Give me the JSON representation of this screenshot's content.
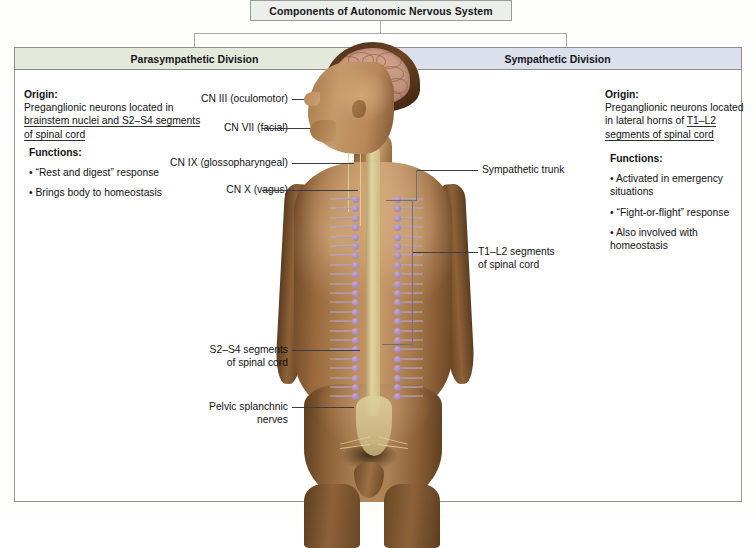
{
  "title": {
    "text": "Components of Autonomic Nervous System"
  },
  "divisions": {
    "left": {
      "header": "Parasympathetic Division",
      "origin_label": "Origin:",
      "origin_text": "Preganglionic neurons located in brainstem nuclei and S2–S4 segments of spinal cord",
      "functions_label": "Functions:",
      "functions": [
        "• “Rest and digest” response",
        "• Brings body to homeostasis"
      ],
      "header_color": "#e3eadb"
    },
    "right": {
      "header": "Sympathetic Division",
      "origin_label": "Origin:",
      "origin_text": "Preganglionic neurons located in lateral horns of T1–L2 segments of spinal cord",
      "functions_label": "Functions:",
      "functions": [
        "• Activated in emergency situations",
        "• “Fight-or-flight” response",
        "• Also involved with homeostasis"
      ],
      "header_color": "#dcdfec"
    }
  },
  "callouts": {
    "left": [
      {
        "text": "CN III (oculomotor)"
      },
      {
        "text": "CN VII (facial)"
      },
      {
        "text": "CN IX (glossopharyngeal)"
      },
      {
        "text": "CN X (vagus)"
      },
      {
        "line1": "S2–S4 segments",
        "line2": "of spinal cord"
      },
      {
        "line1": "Pelvic splanchnic",
        "line2": "nerves"
      }
    ],
    "right": [
      {
        "text": "Sympathetic trunk"
      },
      {
        "line1": "T1–L2 segments",
        "line2": "of spinal cord"
      }
    ]
  },
  "figure": {
    "alt": "Anterior view of human body showing brain, spinal cord, sympathetic trunk ganglia and cranial nerves"
  }
}
